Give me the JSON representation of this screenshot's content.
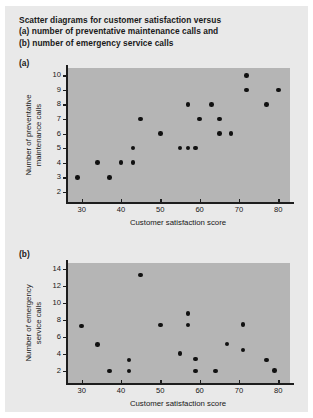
{
  "figure": {
    "caption_line1": "Scatter diagrams for customer satisfaction versus",
    "caption_line2": "(a) number of preventative maintenance calls and",
    "caption_line3": "(b) number of emergency service calls",
    "panel_a_tag": "(a)",
    "panel_b_tag": "(b)",
    "background_color": "#e9e9e9",
    "plot_background_color": "#b5b5b5",
    "marker_color": "#111111",
    "axis_color": "#1d1d1d"
  },
  "chart_data": [
    {
      "type": "scatter",
      "panel": "(a)",
      "title": "Scatter diagrams for customer satisfaction versus (a) number of preventative maintenance calls and (b) number of emergency service calls",
      "xlabel": "Customer satisfaction score",
      "ylabel": "Number of preventative maintenance calls",
      "xlim": [
        26,
        83
      ],
      "ylim": [
        1.3,
        10.5
      ],
      "xticks": [
        30,
        40,
        50,
        60,
        70,
        80
      ],
      "yticks": [
        2,
        3,
        4,
        5,
        6,
        7,
        8,
        9,
        10
      ],
      "xticklabels": [
        "30",
        "40",
        "50",
        "60",
        "70",
        "80"
      ],
      "yticklabels": [
        "2",
        "3",
        "4",
        "5",
        "6",
        "7",
        "8",
        "9",
        "10"
      ],
      "grid": false,
      "legend": null,
      "x": [
        29,
        34,
        37,
        40,
        43,
        43,
        45,
        50,
        55,
        57,
        57,
        59,
        60,
        63,
        65,
        65,
        68,
        72,
        72,
        77,
        80
      ],
      "y": [
        3,
        4,
        3,
        4,
        4,
        5,
        7,
        6,
        5,
        5,
        8,
        5,
        7,
        8,
        6,
        7,
        6,
        9,
        10,
        8,
        9
      ]
    },
    {
      "type": "scatter",
      "panel": "(b)",
      "xlabel": "Customer satisfaction score",
      "ylabel": "Number of emergency service calls",
      "xlim": [
        26,
        83
      ],
      "ylim": [
        0.6,
        14.7
      ],
      "xticks": [
        30,
        40,
        50,
        60,
        70,
        80
      ],
      "yticks": [
        2,
        4,
        6,
        8,
        10,
        12,
        14
      ],
      "xticklabels": [
        "30",
        "40",
        "50",
        "60",
        "70",
        "80"
      ],
      "yticklabels": [
        "2",
        "4",
        "6",
        "8",
        "10",
        "12",
        "14"
      ],
      "grid": false,
      "legend": null,
      "x": [
        30,
        34,
        37,
        42,
        42,
        45,
        50,
        55,
        57,
        57,
        59,
        59,
        64,
        67,
        71,
        71,
        77,
        79
      ],
      "y": [
        7.3,
        5.1,
        2.0,
        3.3,
        2.0,
        13.3,
        7.4,
        4.1,
        8.8,
        7.4,
        3.4,
        2.0,
        2.0,
        5.2,
        7.5,
        4.5,
        3.3,
        2.1
      ]
    }
  ]
}
